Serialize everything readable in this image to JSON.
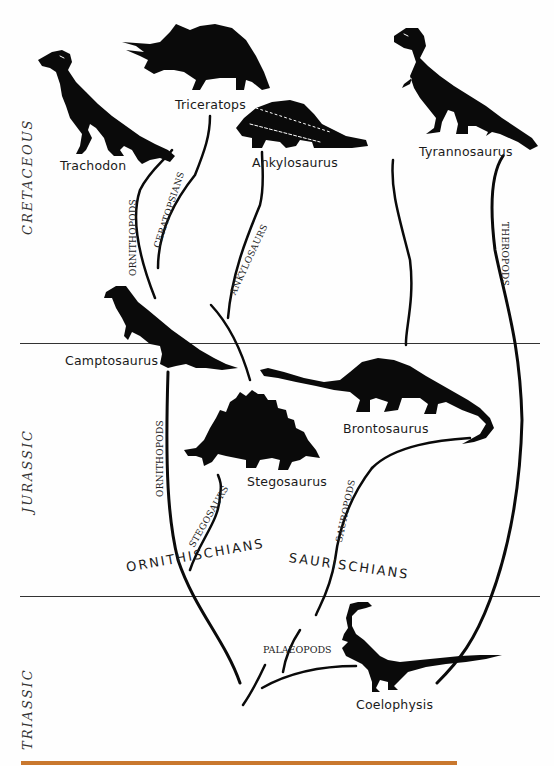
{
  "periods": [
    {
      "name": "CRETACEOUS"
    },
    {
      "name": "JURASSIC"
    },
    {
      "name": "TRIASSIC"
    }
  ],
  "dinosaurs": {
    "trachodon": "Trachodon",
    "triceratops": "Triceratops",
    "ankylosaurus": "Ankylosaurus",
    "tyrannosaurus": "Tyrannosaurus",
    "camptosaurus": "Camptosaurus",
    "brontosaurus": "Brontosaurus",
    "stegosaurus": "Stegosaurus",
    "coelophysis": "Coelophysis"
  },
  "lineages": {
    "ornithopods_upper": "ORNITHOPODS",
    "ceratopsians": "CERATOPSIANS",
    "ankylosaurs": "ANKYLOSAURS",
    "theropods": "THEROPODS",
    "ornithopods_lower": "ORNITHOPODS",
    "stegosaurs": "STEGOSAURS",
    "sauropods": "SAUROPODS",
    "palaeopods": "PALAEOPODS"
  },
  "groups": {
    "ornithischians": "ORNITHISCHIANS",
    "saurischians": "SAURISCHIANS"
  },
  "colors": {
    "ink": "#0a0a0a",
    "rule": "#333333",
    "bottom_bar": "#c9782e",
    "background": "#fefefe"
  }
}
